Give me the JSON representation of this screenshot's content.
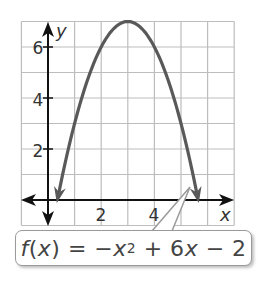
{
  "chart_data": {
    "type": "line",
    "title": "",
    "function": "f(x) = -x^2 + 6x - 2",
    "xlabel": "x",
    "ylabel": "y",
    "xlim": [
      -1,
      7
    ],
    "ylim": [
      -1,
      7
    ],
    "grid": true,
    "x_ticks": [
      2,
      4
    ],
    "y_ticks": [
      2,
      4,
      6
    ],
    "vertex": [
      3,
      7
    ],
    "series": [
      {
        "name": "f(x) = -x^2 + 6x - 2",
        "x": [
          0.35,
          0.5,
          1,
          1.5,
          2,
          2.5,
          3,
          3.5,
          4,
          4.5,
          5,
          5.5,
          5.65
        ],
        "y": [
          -0.0,
          0.75,
          3,
          4.75,
          6,
          6.75,
          7,
          6.75,
          6,
          4.75,
          3,
          0.75,
          0.0
        ]
      }
    ],
    "annotations": [
      "f(x) = −x² + 6x − 2"
    ]
  },
  "labels": {
    "y_axis": "y",
    "x_axis": "x",
    "tick_2x": "2",
    "tick_4x": "4",
    "tick_2y": "2",
    "tick_4y": "4",
    "tick_6y": "6"
  },
  "callout": {
    "f": "f",
    "paren_open": "(",
    "x1": "x",
    "paren_close": ")",
    "eq": " = −",
    "x2": "x",
    "exp": "2",
    "plus": " + 6",
    "x3": "x",
    "tail": " − 2"
  },
  "colors": {
    "curve": "#595959",
    "grid": "#bdbdbd",
    "axis": "#111111"
  }
}
